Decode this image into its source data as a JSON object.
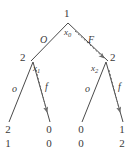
{
  "figure": {
    "name": "extensive-form-game-tree",
    "background_color": "#ffffff",
    "line_color": "#4a4a4a",
    "text_color": "#3a3a3a"
  },
  "nodes": {
    "root": {
      "player": "1",
      "name": "x",
      "subscript": "0"
    },
    "left": {
      "player": "2",
      "name": "x",
      "subscript": "1"
    },
    "right": {
      "player": "2",
      "name": "x",
      "subscript": "2"
    }
  },
  "actions": {
    "root_left": "O",
    "root_right": "F",
    "left_left": "o",
    "left_right": "f",
    "right_left": "o",
    "right_right": "f"
  },
  "leaves": [
    {
      "name": "leaf-1",
      "top": "2",
      "bottom": "1"
    },
    {
      "name": "leaf-2",
      "top": "0",
      "bottom": "0"
    },
    {
      "name": "leaf-3",
      "top": "0",
      "bottom": "0"
    },
    {
      "name": "leaf-4",
      "top": "1",
      "bottom": "2"
    }
  ],
  "equilibrium_path": {
    "arrows": [
      "root-to-right-node",
      "left-node-to-f-leaf",
      "right-node-to-f-leaf"
    ]
  }
}
